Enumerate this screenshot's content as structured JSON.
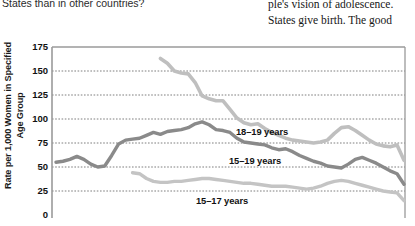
{
  "page": {
    "left_column_text": "States than in other countries?",
    "right_column_lines": [
      "ple's vision of adolescence.",
      "States give birth. The good"
    ]
  },
  "chart_data": {
    "type": "line",
    "title": "",
    "xlabel": "",
    "ylabel": "Rate per 1,000 Women in Specified Age Group",
    "ylabel_lines": [
      "Rate per 1,000 Women in Specified",
      "Age Group"
    ],
    "ylim": [
      0,
      175
    ],
    "yticks": [
      175,
      150,
      125,
      100,
      75,
      50,
      25,
      0
    ],
    "grid": true,
    "grid_style": "dotted-horizontal",
    "legend": "inline-labels",
    "colors": {
      "series_18_19": "#bfbfbf",
      "series_15_19": "#8a8a8a",
      "series_15_17": "#c4c4c4",
      "axis": "#9a9a9a",
      "grid": "#6f6f6f",
      "text": "#111111"
    },
    "x": [
      0,
      2,
      4,
      6,
      8,
      10,
      12,
      14,
      16,
      18,
      20,
      22,
      24,
      26,
      28,
      30,
      32,
      34,
      36,
      38,
      40,
      42,
      44,
      46,
      48,
      50,
      52,
      54,
      56,
      58,
      60,
      62,
      64,
      66,
      68,
      70,
      72,
      74,
      76,
      78,
      80,
      82,
      84,
      86,
      88,
      90,
      92,
      94,
      96,
      98,
      100
    ],
    "series": [
      {
        "name": "18–19 years",
        "label": "18–19 years",
        "label_position": "middle-right",
        "start_index": 30,
        "values": [
          null,
          null,
          null,
          null,
          null,
          null,
          null,
          null,
          null,
          null,
          null,
          null,
          null,
          null,
          null,
          163,
          158,
          150,
          148,
          147,
          138,
          124,
          121,
          119,
          119,
          110,
          101,
          96,
          94,
          95,
          90,
          86,
          83,
          80,
          78,
          77,
          76,
          75,
          76,
          78,
          85,
          91,
          92,
          88,
          83,
          78,
          74,
          72,
          71,
          73,
          57
        ]
      },
      {
        "name": "15–19 years",
        "label": "15–19 years",
        "label_position": "middle-right",
        "start_index": 0,
        "values": [
          55,
          56,
          58,
          61,
          58,
          53,
          50,
          51,
          62,
          74,
          78,
          79,
          80,
          83,
          86,
          84,
          87,
          88,
          89,
          91,
          95,
          97,
          94,
          89,
          88,
          86,
          80,
          76,
          75,
          74,
          73,
          70,
          68,
          69,
          66,
          62,
          59,
          56,
          54,
          51,
          50,
          49,
          53,
          58,
          60,
          57,
          54,
          50,
          46,
          43,
          32
        ]
      },
      {
        "name": "15–17 years",
        "label": "15–17 years",
        "label_position": "bottom-center",
        "start_index": 22,
        "values": [
          null,
          null,
          null,
          null,
          null,
          null,
          null,
          null,
          null,
          null,
          null,
          44,
          43,
          38,
          35,
          34,
          34,
          35,
          35,
          36,
          37,
          38,
          38,
          37,
          36,
          35,
          34,
          33,
          33,
          32,
          31,
          30,
          30,
          30,
          29,
          28,
          27,
          28,
          30,
          33,
          35,
          36,
          35,
          33,
          31,
          29,
          27,
          25,
          24,
          23,
          15
        ]
      }
    ]
  }
}
